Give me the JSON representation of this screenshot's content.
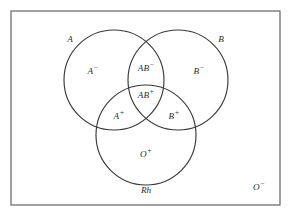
{
  "figure": {
    "background_color": "#ffffff",
    "frame_color": "#6e6e6e",
    "circle_color": "#3a3a3a",
    "text_color": "#2b2b2b"
  },
  "frame": {
    "x": 11,
    "y": 11,
    "width": 269,
    "height": 194
  },
  "sets": [
    {
      "name": "set-a",
      "label": "A",
      "label_x": 70,
      "label_y": 40,
      "cx": 114,
      "cy": 80,
      "r": 50
    },
    {
      "name": "set-b",
      "label": "B",
      "label_x": 221,
      "label_y": 40,
      "cx": 178,
      "cy": 80,
      "r": 50
    },
    {
      "name": "set-rh",
      "label": "Rh",
      "label_x": 146,
      "label_y": 191,
      "cx": 146,
      "cy": 135,
      "r": 50
    }
  ],
  "regions": [
    {
      "name": "region-a-negative",
      "base": "A",
      "sign": "−",
      "x": 93,
      "y": 72
    },
    {
      "name": "region-ab-negative",
      "base": "AB",
      "sign": "−",
      "x": 146,
      "y": 69
    },
    {
      "name": "region-b-negative",
      "base": "B",
      "sign": "−",
      "x": 199,
      "y": 72
    },
    {
      "name": "region-ab-positive",
      "base": "AB",
      "sign": "+",
      "x": 146,
      "y": 96
    },
    {
      "name": "region-a-positive",
      "base": "A",
      "sign": "+",
      "x": 119,
      "y": 117
    },
    {
      "name": "region-b-positive",
      "base": "B",
      "sign": "+",
      "x": 174,
      "y": 117
    },
    {
      "name": "region-o-positive",
      "base": "O",
      "sign": "+",
      "x": 146,
      "y": 155
    },
    {
      "name": "region-o-negative",
      "base": "O",
      "sign": "−",
      "x": 259,
      "y": 188
    }
  ]
}
